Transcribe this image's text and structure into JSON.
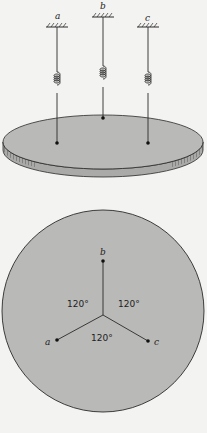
{
  "figure": {
    "top_view": {
      "supports": [
        {
          "label": "a",
          "x": 57,
          "y": 27
        },
        {
          "label": "b",
          "x": 103,
          "y": 17
        },
        {
          "label": "c",
          "x": 148,
          "y": 27
        }
      ],
      "attach_points": [
        {
          "label": "a",
          "x": 57,
          "y": 143
        },
        {
          "label": "b",
          "x": 103,
          "y": 118
        },
        {
          "label": "c",
          "x": 148,
          "y": 143
        }
      ]
    },
    "plan_view": {
      "points": [
        {
          "label": "a",
          "x": 57,
          "y": 340
        },
        {
          "label": "b",
          "x": 103,
          "y": 260
        },
        {
          "label": "c",
          "x": 148,
          "y": 340
        }
      ],
      "angles": [
        "120°",
        "120°",
        "120°"
      ]
    },
    "colors": {
      "background": "#f3f3f1",
      "disk_fill": "#b9b9b7",
      "line": "#2a2a2a"
    }
  }
}
